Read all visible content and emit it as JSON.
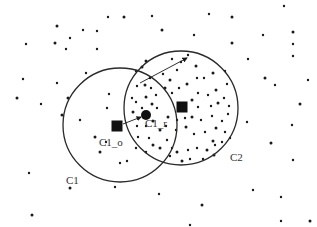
{
  "diagram": {
    "width": 317,
    "height": 227,
    "colors": {
      "ink": "#1a1a1a",
      "circle_stroke": "#2a2a2a",
      "label": "#333333",
      "background": "#ffffff"
    },
    "clusters": [
      {
        "id": "C1",
        "label": "C1",
        "cx": 120,
        "cy": 125,
        "r": 57,
        "label_x": 66,
        "label_y": 174
      },
      {
        "id": "C2",
        "label": "C2",
        "cx": 181,
        "cy": 108,
        "r": 57,
        "label_x": 230,
        "label_y": 152
      }
    ],
    "markers": [
      {
        "id": "C1_o",
        "shape": "square",
        "x": 117,
        "y": 126,
        "size": 11,
        "label": "C1_o",
        "label_x": 99,
        "label_y": 137
      },
      {
        "id": "C1_r",
        "shape": "circle",
        "x": 146,
        "y": 115,
        "r": 5,
        "label": "C1_r",
        "label_x": 145,
        "label_y": 118
      },
      {
        "id": "C2_center",
        "shape": "square",
        "x": 182,
        "y": 107,
        "size": 11,
        "label": ""
      }
    ],
    "arrows": [
      {
        "id": "c1o-to-c1r",
        "x1": 123,
        "y1": 124,
        "x2": 141,
        "y2": 117
      },
      {
        "id": "c2-radius",
        "x1": 140,
        "y1": 83,
        "x2": 187,
        "y2": 58
      }
    ],
    "points": [
      [
        57,
        26
      ],
      [
        83,
        30
      ],
      [
        108,
        17
      ],
      [
        124,
        17
      ],
      [
        152,
        16
      ],
      [
        209,
        14
      ],
      [
        232,
        17
      ],
      [
        284,
        6
      ],
      [
        26,
        44
      ],
      [
        55,
        43
      ],
      [
        70,
        38
      ],
      [
        97,
        31
      ],
      [
        162,
        30
      ],
      [
        194,
        35
      ],
      [
        263,
        35
      ],
      [
        293,
        32
      ],
      [
        66,
        49
      ],
      [
        97,
        49
      ],
      [
        232,
        43
      ],
      [
        293,
        44
      ],
      [
        248,
        59
      ],
      [
        265,
        78
      ],
      [
        293,
        56
      ],
      [
        23,
        79
      ],
      [
        17,
        98
      ],
      [
        57,
        83
      ],
      [
        86,
        73
      ],
      [
        68,
        98
      ],
      [
        41,
        104
      ],
      [
        109,
        94
      ],
      [
        62,
        115
      ],
      [
        275,
        85
      ],
      [
        308,
        80
      ],
      [
        300,
        104
      ],
      [
        292,
        125
      ],
      [
        247,
        122
      ],
      [
        271,
        143
      ],
      [
        293,
        160
      ],
      [
        29,
        173
      ],
      [
        70,
        188
      ],
      [
        115,
        187
      ],
      [
        159,
        194
      ],
      [
        202,
        205
      ],
      [
        253,
        190
      ],
      [
        281,
        197
      ],
      [
        32,
        215
      ],
      [
        190,
        225
      ],
      [
        281,
        221
      ],
      [
        310,
        221
      ],
      [
        107,
        108
      ],
      [
        106,
        142
      ],
      [
        100,
        152
      ],
      [
        120,
        163
      ],
      [
        127,
        161
      ],
      [
        95,
        137
      ],
      [
        80,
        120
      ],
      [
        136,
        71
      ],
      [
        146,
        61
      ],
      [
        172,
        59
      ],
      [
        188,
        55
      ],
      [
        142,
        67
      ],
      [
        150,
        78
      ],
      [
        137,
        86
      ],
      [
        145,
        85
      ],
      [
        151,
        88
      ],
      [
        132,
        98
      ],
      [
        146,
        97
      ],
      [
        136,
        102
      ],
      [
        142,
        108
      ],
      [
        152,
        104
      ],
      [
        157,
        108
      ],
      [
        156,
        95
      ],
      [
        133,
        112
      ],
      [
        137,
        126
      ],
      [
        146,
        126
      ],
      [
        153,
        121
      ],
      [
        138,
        137
      ],
      [
        149,
        138
      ],
      [
        153,
        145
      ],
      [
        136,
        148
      ],
      [
        146,
        152
      ],
      [
        160,
        130
      ],
      [
        166,
        126
      ],
      [
        167,
        140
      ],
      [
        160,
        148
      ],
      [
        172,
        148
      ],
      [
        163,
        74
      ],
      [
        170,
        80
      ],
      [
        177,
        70
      ],
      [
        181,
        62
      ],
      [
        196,
        66
      ],
      [
        197,
        78
      ],
      [
        204,
        78
      ],
      [
        213,
        73
      ],
      [
        225,
        71
      ],
      [
        227,
        84
      ],
      [
        165,
        88
      ],
      [
        172,
        93
      ],
      [
        179,
        88
      ],
      [
        187,
        84
      ],
      [
        198,
        93
      ],
      [
        208,
        95
      ],
      [
        216,
        90
      ],
      [
        224,
        98
      ],
      [
        229,
        106
      ],
      [
        192,
        100
      ],
      [
        198,
        107
      ],
      [
        211,
        106
      ],
      [
        218,
        103
      ],
      [
        228,
        114
      ],
      [
        222,
        121
      ],
      [
        168,
        117
      ],
      [
        177,
        120
      ],
      [
        185,
        118
      ],
      [
        192,
        117
      ],
      [
        201,
        120
      ],
      [
        212,
        116
      ],
      [
        216,
        128
      ],
      [
        225,
        132
      ],
      [
        176,
        130
      ],
      [
        186,
        127
      ],
      [
        194,
        134
      ],
      [
        205,
        132
      ],
      [
        213,
        141
      ],
      [
        222,
        142
      ],
      [
        170,
        156
      ],
      [
        177,
        152
      ],
      [
        188,
        150
      ],
      [
        197,
        148
      ],
      [
        207,
        150
      ],
      [
        215,
        145
      ],
      [
        230,
        138
      ],
      [
        182,
        161
      ],
      [
        190,
        159
      ],
      [
        203,
        159
      ],
      [
        214,
        155
      ]
    ]
  }
}
